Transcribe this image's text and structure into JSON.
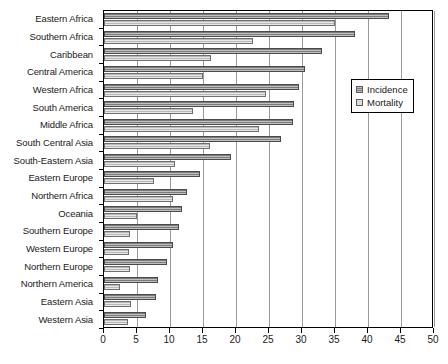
{
  "chart_data": {
    "type": "bar",
    "orientation": "horizontal",
    "title": "",
    "xlabel": "",
    "ylabel": "",
    "xlim": [
      0,
      50
    ],
    "xticks": [
      0,
      5,
      10,
      15,
      20,
      25,
      30,
      35,
      40,
      45,
      50
    ],
    "grid": true,
    "legend_position": "right",
    "categories": [
      "Eastern Africa",
      "Southern Africa",
      "Caribbean",
      "Central America",
      "Western Africa",
      "South America",
      "Middle Africa",
      "South Central Asia",
      "South-Eastern Asia",
      "Eastern Europe",
      "Northern Africa",
      "Oceania",
      "Southern Europe",
      "Western Europe",
      "Northern Europe",
      "Northern America",
      "Eastern Asia",
      "Western Asia"
    ],
    "series": [
      {
        "name": "Incidence",
        "color": "#8c8c8c",
        "values": [
          43.2,
          38.0,
          33.0,
          30.5,
          29.5,
          28.8,
          28.6,
          26.8,
          19.2,
          14.5,
          12.5,
          11.8,
          11.3,
          10.5,
          9.5,
          8.2,
          7.9,
          6.4
        ]
      },
      {
        "name": "Mortality",
        "color": "#dcdcdc",
        "values": [
          35.0,
          22.5,
          16.2,
          15.0,
          24.5,
          13.5,
          23.5,
          16.0,
          10.8,
          7.5,
          10.5,
          5.0,
          4.0,
          3.8,
          4.0,
          2.4,
          4.1,
          3.6
        ]
      }
    ]
  },
  "legend": {
    "items": [
      {
        "label": "Incidence"
      },
      {
        "label": "Mortality"
      }
    ]
  },
  "colors": {
    "incidence": "#8c8c8c",
    "mortality": "#dcdcdc",
    "axis": "#000000",
    "grid": "#9a9a9a",
    "background": "#ffffff"
  }
}
